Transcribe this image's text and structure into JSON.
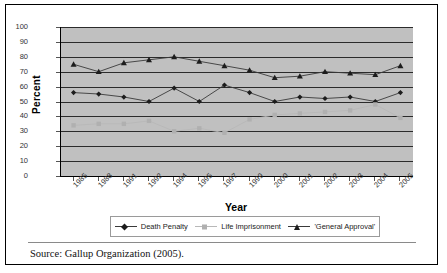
{
  "figure": {
    "source_note": "Source: Gallup Organization (2005)."
  },
  "chart_data": {
    "type": "line",
    "title": "",
    "xlabel": "Year",
    "ylabel": "Percent",
    "ylim": [
      0,
      100
    ],
    "ytick_step": 10,
    "yticks": [
      0,
      10,
      20,
      30,
      40,
      50,
      60,
      70,
      80,
      90,
      100
    ],
    "grid": true,
    "legend_position": "bottom",
    "plot_background": "#c0c0c0",
    "categories": [
      "1985",
      "1988",
      "1991",
      "1992",
      "1994",
      "1995",
      "1997",
      "1999",
      "2000",
      "2001",
      "2002",
      "2003",
      "2004",
      "2005"
    ],
    "series": [
      {
        "name": "Death Penalty",
        "marker": "diamond",
        "color": "#1c1c1c",
        "values": [
          56,
          55,
          53,
          50,
          59,
          50,
          61,
          56,
          50,
          53,
          52,
          53,
          50,
          56
        ]
      },
      {
        "name": "Life Imprisonment",
        "marker": "square",
        "color": "#b0b0b0",
        "values": [
          34,
          35,
          35,
          37,
          30,
          32,
          29,
          38,
          41,
          42,
          43,
          44,
          48,
          39
        ]
      },
      {
        "name": "'General Approval'",
        "marker": "triangle",
        "color": "#1c1c1c",
        "values": [
          75,
          70,
          76,
          78,
          80,
          77,
          74,
          71,
          66,
          67,
          70,
          69,
          68,
          74
        ]
      }
    ]
  }
}
